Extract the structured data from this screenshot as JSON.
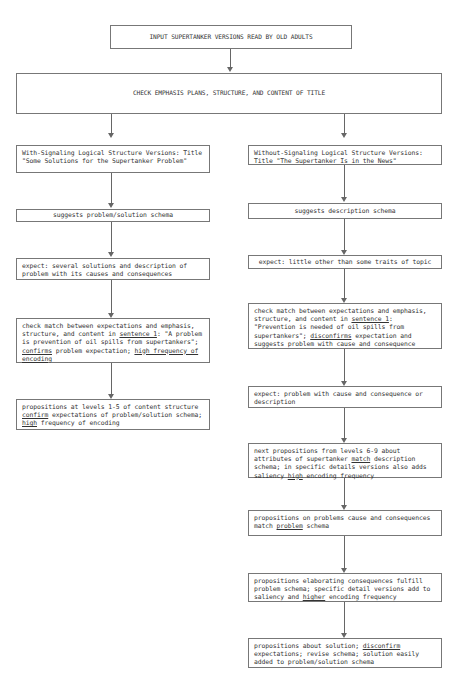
{
  "diagram": {
    "type": "flowchart",
    "top_box": {
      "text": "INPUT SUPERTANKER VERSIONS READ BY OLD ADULTS"
    },
    "title_box": {
      "text": "CHECK EMPHASIS PLANS, STRUCTURE, AND CONTENT OF TITLE"
    },
    "left_branch": {
      "boxes": [
        {
          "text": "With-Signaling Logical Structure Versions: Title \"Some Solutions for the Supertanker Problem\""
        },
        {
          "text": "suggests problem/solution schema"
        },
        {
          "text": "expect:  several solutions and description of problem with its causes and consequences"
        },
        {
          "parts": {
            "a": "check match between expectations and emphasis, structure, and content in ",
            "b": "sentence 1",
            "c": ":  \"A problem is prevention of oil spills from supertankers\"; ",
            "d": "confirms",
            "e": " problem expectation; ",
            "f": "high frequency of encoding"
          }
        },
        {
          "parts": {
            "a": "propositions at levels 1-5 of content structure ",
            "b": "confirm",
            "c": " expectations of problem/solution schema; ",
            "d": "high",
            "e": " frequency of encoding"
          }
        }
      ]
    },
    "right_branch": {
      "boxes": [
        {
          "text": "Without-Signaling Logical Structure Versions: Title \"The Supertanker Is in the News\""
        },
        {
          "text": "suggests description schema"
        },
        {
          "text": "expect: little other than some traits of topic"
        },
        {
          "parts": {
            "a": "check match between expectations and emphasis, structure, and content in ",
            "b": "sentence 1",
            "c": ":  \"Prevention is needed of oil spills from supertankers\"; ",
            "d": "disconfirms",
            "e": " expectation and suggests problem with cause and consequence"
          }
        },
        {
          "text": "expect: problem with cause and consequence or description"
        },
        {
          "parts": {
            "a": "next propositions from levels 6-9 about attributes of supertanker ",
            "b": "match",
            "c": " description schema; in specific details versions also adds saliency ",
            "d": "high",
            "e": " encoding frequency"
          }
        },
        {
          "parts": {
            "a": "propositions on problems cause and consequences match ",
            "b": "problem",
            "c": " schema"
          }
        },
        {
          "parts": {
            "a": "propositions elaborating consequences fulfill problem schema; specific detail versions add to saliency and ",
            "b": "higher",
            "c": " encoding frequency"
          }
        },
        {
          "parts": {
            "a": "propositions about solution; ",
            "b": "disconfirm",
            "c": " expectations; revise schema; solution easily added to problem/solution schema"
          }
        }
      ]
    },
    "colors": {
      "line": "#666666",
      "border": "#777777",
      "text": "#333333",
      "background": "#ffffff"
    }
  }
}
